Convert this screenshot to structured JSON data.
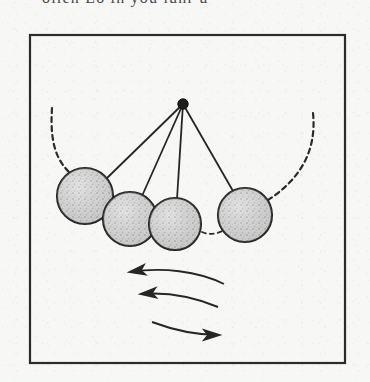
{
  "document": {
    "top_cropped_text": "ollen   Lo in you lunr u",
    "background_color": "#f7f7f5",
    "ink_color": "#262626"
  },
  "figure": {
    "name": "newtons-cradle-pendulum-diagram",
    "frame": {
      "x": 30,
      "y": 35,
      "width": 315,
      "height": 328,
      "stroke": "#2b2b2b",
      "stroke_width": 2
    },
    "pivot": {
      "x": 183,
      "y": 104,
      "radius": 5,
      "fill": "#1c1c1c"
    },
    "balls": [
      {
        "id": "ball-1",
        "cx": 85,
        "cy": 196,
        "r": 28,
        "fill": "#cfcfcf",
        "stroke": "#2b2b2b"
      },
      {
        "id": "ball-2",
        "cx": 130,
        "cy": 219,
        "r": 27,
        "fill": "#cfcfcf",
        "stroke": "#2b2b2b"
      },
      {
        "id": "ball-3",
        "cx": 175,
        "cy": 224,
        "r": 26,
        "fill": "#cfcfcf",
        "stroke": "#2b2b2b"
      },
      {
        "id": "ball-4",
        "cx": 245,
        "cy": 215,
        "r": 27,
        "fill": "#cfcfcf",
        "stroke": "#2b2b2b"
      }
    ],
    "strings": [
      {
        "id": "string-1",
        "x1": 183,
        "y1": 104,
        "x2": 106,
        "y2": 179
      },
      {
        "id": "string-2",
        "x1": 183,
        "y1": 104,
        "x2": 142,
        "y2": 195
      },
      {
        "id": "string-3",
        "x1": 183,
        "y1": 104,
        "x2": 177,
        "y2": 198
      },
      {
        "id": "string-4",
        "x1": 183,
        "y1": 104,
        "x2": 232,
        "y2": 191
      }
    ],
    "arcs": [
      {
        "id": "arc-left-dashed",
        "d": "M 52 108 C 50 140, 55 158, 69 172",
        "dash": "5,4"
      },
      {
        "id": "arc-right-dashed",
        "d": "M 313 113 C 316 150, 300 178, 268 199",
        "dash": "5,4"
      },
      {
        "id": "arc-swing-dashed",
        "d": "M 203 231 C 213 234, 222 231, 229 226",
        "dash": "5,4"
      }
    ],
    "motion_arrows": [
      {
        "id": "motion-arrow-1",
        "direction": "left",
        "d": "M 222 284 C 196 272, 160 268, 128 272",
        "head": "128,272"
      },
      {
        "id": "motion-arrow-2",
        "direction": "left",
        "d": "M 216 306 C 192 296, 164 291, 139 293",
        "head": "139,293"
      },
      {
        "id": "motion-arrow-3",
        "direction": "right",
        "d": "M 152 321 C 176 330, 198 334, 218 334",
        "head": "218,334"
      }
    ],
    "caption_labels": []
  }
}
